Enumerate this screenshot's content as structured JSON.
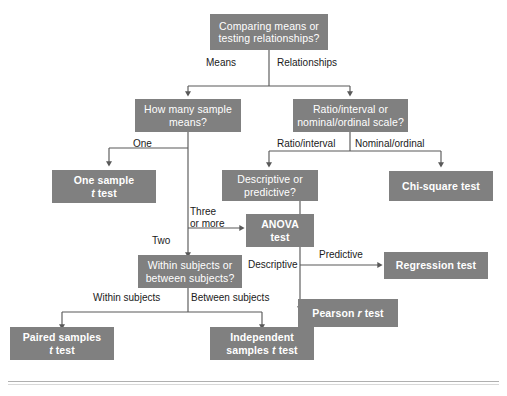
{
  "diagram": {
    "box_fill_color": "#808080",
    "box_text_color": "#ffffff",
    "line_color": "#595959",
    "label_text_color": "#1a1a1a",
    "nodes": {
      "root": {
        "line1": "Comparing means or",
        "line2": "testing relationships?",
        "kind": "decision"
      },
      "how_many_means": {
        "line1": "How many sample",
        "line2": "means?",
        "kind": "decision"
      },
      "scale_type": {
        "line1": "Ratio/interval or",
        "line2": "nominal/ordinal scale?",
        "kind": "decision"
      },
      "one_sample": {
        "line1": "One sample",
        "line2": "t test",
        "kind": "terminal"
      },
      "descriptive_predictive": {
        "line1": "Descriptive or",
        "line2": "predictive?",
        "kind": "decision"
      },
      "chi_square": {
        "line1": "Chi-square test",
        "line2": "",
        "kind": "terminal"
      },
      "anova": {
        "line1": "ANOVA",
        "line2": "test",
        "kind": "terminal"
      },
      "within_between": {
        "line1": "Within subjects or",
        "line2": "between subjects?",
        "kind": "decision"
      },
      "regression": {
        "line1": "Regression test",
        "line2": "",
        "kind": "terminal"
      },
      "pearson": {
        "line1": "Pearson r test",
        "line2": "",
        "kind": "terminal"
      },
      "paired_samples": {
        "line1": "Paired samples",
        "line2": "t test",
        "kind": "terminal"
      },
      "independent_samples": {
        "line1": "Independent",
        "line2": "samples t test",
        "kind": "terminal"
      }
    },
    "edge_labels": {
      "means": "Means",
      "relationships": "Relationships",
      "one": "One",
      "three_or_more_line1": "Three",
      "three_or_more_line2": "or more",
      "two": "Two",
      "ratio_interval": "Ratio/interval",
      "nominal_ordinal": "Nominal/ordinal",
      "descriptive": "Descriptive",
      "predictive": "Predictive",
      "within_subjects": "Within subjects",
      "between_subjects": "Between subjects"
    }
  }
}
